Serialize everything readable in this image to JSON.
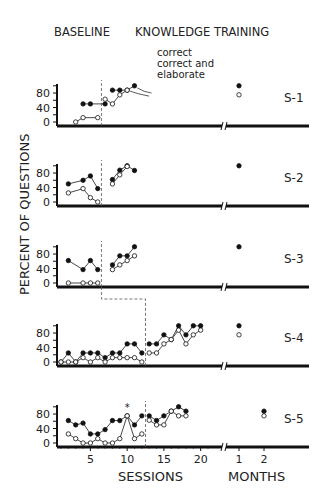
{
  "chart_data": {
    "type": "line",
    "title": "",
    "phase_labels": [
      "BASELINE",
      "KNOWLEDGE TRAINING"
    ],
    "xlabel": "SESSIONS",
    "xlabel_followup": "MONTHS",
    "ylabel": "PERCENT OF QUESTIONS",
    "x_ticks": [
      5,
      10,
      15,
      20
    ],
    "followup_ticks": [
      1,
      2
    ],
    "y_ticks": [
      0,
      40,
      80
    ],
    "ylim": [
      0,
      100
    ],
    "legend": [
      {
        "name": "correct",
        "marker": "filled-circle"
      },
      {
        "name": "correct and elaborate",
        "marker": "open-circle"
      }
    ],
    "annotation": "*",
    "panels": [
      {
        "label": "S-1",
        "phase_change_after_session": 6.5,
        "series": [
          {
            "name": "correct",
            "baseline": [
              [
                4,
                50
              ],
              [
                5,
                50
              ],
              [
                7,
                50
              ]
            ],
            "training": [
              [
                8,
                88
              ],
              [
                9,
                88
              ],
              [
                10,
                88
              ],
              [
                11,
                100
              ]
            ],
            "followup": [
              [
                1,
                100
              ]
            ]
          },
          {
            "name": "correct and elaborate",
            "baseline": [
              [
                3,
                0
              ],
              [
                4,
                12
              ],
              [
                6,
                12
              ]
            ],
            "training": [
              [
                7,
                63
              ],
              [
                8,
                50
              ],
              [
                9,
                75
              ],
              [
                10,
                88
              ]
            ],
            "followup": [
              [
                1,
                75
              ]
            ]
          }
        ]
      },
      {
        "label": "S-2",
        "phase_change_after_session": 6.5,
        "series": [
          {
            "name": "correct",
            "baseline": [
              [
                2,
                50
              ],
              [
                4,
                60
              ],
              [
                5,
                72
              ],
              [
                6,
                37
              ]
            ],
            "training": [
              [
                8,
                62
              ],
              [
                9,
                88
              ],
              [
                10,
                100
              ],
              [
                11,
                87
              ]
            ],
            "followup": [
              [
                1,
                100
              ]
            ]
          },
          {
            "name": "correct and elaborate",
            "baseline": [
              [
                2,
                25
              ],
              [
                4,
                37
              ],
              [
                5,
                12
              ],
              [
                6,
                0
              ]
            ],
            "training": [
              [
                8,
                50
              ],
              [
                9,
                75
              ],
              [
                10,
                98
              ]
            ],
            "followup": []
          }
        ]
      },
      {
        "label": "S-3",
        "phase_change_after_session": 6.5,
        "series": [
          {
            "name": "correct",
            "baseline": [
              [
                2,
                62
              ],
              [
                4,
                37
              ],
              [
                5,
                62
              ],
              [
                6,
                37
              ]
            ],
            "training": [
              [
                8,
                50
              ],
              [
                9,
                75
              ],
              [
                10,
                75
              ],
              [
                11,
                100
              ]
            ],
            "followup": [
              [
                1,
                100
              ]
            ]
          },
          {
            "name": "correct and elaborate",
            "baseline": [
              [
                2,
                0
              ],
              [
                4,
                0
              ],
              [
                5,
                0
              ],
              [
                6,
                0
              ]
            ],
            "training": [
              [
                8,
                37
              ],
              [
                9,
                50
              ],
              [
                10,
                62
              ],
              [
                11,
                75
              ]
            ],
            "followup": []
          }
        ]
      },
      {
        "label": "S-4",
        "phase_change_after_session": 12.5,
        "series": [
          {
            "name": "correct",
            "baseline": [
              [
                1,
                0
              ],
              [
                2,
                25
              ],
              [
                3,
                0
              ],
              [
                4,
                25
              ],
              [
                5,
                25
              ],
              [
                6,
                25
              ],
              [
                7,
                12
              ],
              [
                8,
                25
              ],
              [
                9,
                25
              ],
              [
                10,
                50
              ],
              [
                11,
                50
              ],
              [
                12,
                25
              ]
            ],
            "training": [
              [
                13,
                50
              ],
              [
                14,
                50
              ],
              [
                15,
                75
              ],
              [
                16,
                62
              ],
              [
                17,
                100
              ],
              [
                18,
                75
              ],
              [
                19,
                100
              ],
              [
                20,
                100
              ]
            ],
            "followup": [
              [
                1,
                100
              ]
            ]
          },
          {
            "name": "correct and elaborate",
            "baseline": [
              [
                1,
                0
              ],
              [
                2,
                0
              ],
              [
                3,
                0
              ],
              [
                4,
                12
              ],
              [
                5,
                0
              ],
              [
                6,
                12
              ],
              [
                7,
                0
              ],
              [
                8,
                12
              ],
              [
                9,
                12
              ],
              [
                10,
                12
              ],
              [
                11,
                12
              ],
              [
                12,
                0
              ]
            ],
            "training": [
              [
                13,
                25
              ],
              [
                14,
                25
              ],
              [
                15,
                50
              ],
              [
                16,
                62
              ],
              [
                17,
                88
              ],
              [
                18,
                50
              ],
              [
                19,
                75
              ],
              [
                20,
                88
              ]
            ],
            "followup": [
              [
                1,
                75
              ]
            ]
          }
        ]
      },
      {
        "label": "S-5",
        "phase_change_after_session": 12.5,
        "series": [
          {
            "name": "correct",
            "baseline": [
              [
                2,
                62
              ],
              [
                3,
                50
              ],
              [
                4,
                55
              ],
              [
                5,
                25
              ],
              [
                6,
                25
              ],
              [
                7,
                37
              ],
              [
                8,
                62
              ],
              [
                9,
                62
              ],
              [
                10,
                75
              ],
              [
                11,
                50
              ],
              [
                12,
                75
              ]
            ],
            "training": [
              [
                13,
                75
              ],
              [
                14,
                62
              ],
              [
                15,
                75
              ],
              [
                16,
                88
              ],
              [
                17,
                100
              ],
              [
                18,
                88
              ]
            ],
            "followup": [
              [
                2,
                88
              ]
            ]
          },
          {
            "name": "correct and elaborate",
            "baseline": [
              [
                2,
                25
              ],
              [
                3,
                12
              ],
              [
                4,
                0
              ],
              [
                5,
                0
              ],
              [
                6,
                12
              ],
              [
                7,
                0
              ],
              [
                8,
                0
              ],
              [
                9,
                12
              ],
              [
                10,
                75
              ],
              [
                11,
                12
              ],
              [
                12,
                25
              ]
            ],
            "training": [
              [
                13,
                63
              ],
              [
                14,
                50
              ],
              [
                15,
                50
              ],
              [
                16,
                88
              ],
              [
                17,
                75
              ],
              [
                18,
                75
              ]
            ],
            "followup": [
              [
                2,
                75
              ]
            ]
          }
        ]
      }
    ]
  }
}
